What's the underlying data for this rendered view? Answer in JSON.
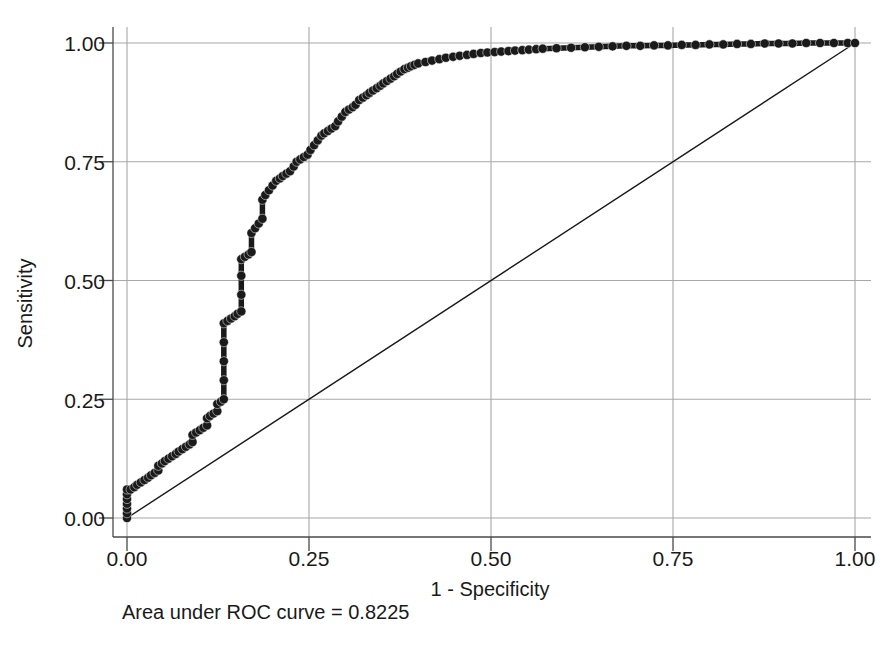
{
  "chart_data": {
    "type": "line",
    "title": "",
    "xlabel": "1 - Specificity",
    "ylabel": "Sensitivity",
    "xlim": [
      0,
      1
    ],
    "ylim": [
      0,
      1
    ],
    "grid": true,
    "legend": null,
    "annotation": "Area under ROC curve = 0.8225",
    "auc": 0.8225,
    "xticks": [
      "0.00",
      "0.25",
      "0.50",
      "0.75",
      "1.00"
    ],
    "yticks": [
      "0.00",
      "0.25",
      "0.50",
      "0.75",
      "1.00"
    ],
    "xtick_values": [
      0,
      0.25,
      0.5,
      0.75,
      1
    ],
    "ytick_values": [
      0,
      0.25,
      0.5,
      0.75,
      1
    ],
    "series": [
      {
        "name": "ROC curve",
        "marker": "filled-circle",
        "color": "#1a1a1a",
        "x": [
          0.0,
          0.0,
          0.0,
          0.0,
          0.0,
          0.0,
          0.0,
          0.005,
          0.01,
          0.014,
          0.019,
          0.024,
          0.029,
          0.033,
          0.038,
          0.043,
          0.043,
          0.048,
          0.052,
          0.057,
          0.062,
          0.067,
          0.071,
          0.076,
          0.081,
          0.086,
          0.09,
          0.09,
          0.095,
          0.1,
          0.105,
          0.11,
          0.11,
          0.114,
          0.119,
          0.124,
          0.124,
          0.129,
          0.133,
          0.133,
          0.133,
          0.133,
          0.133,
          0.138,
          0.143,
          0.148,
          0.152,
          0.157,
          0.157,
          0.157,
          0.157,
          0.162,
          0.167,
          0.171,
          0.171,
          0.176,
          0.181,
          0.186,
          0.186,
          0.19,
          0.195,
          0.2,
          0.205,
          0.21,
          0.214,
          0.219,
          0.224,
          0.229,
          0.233,
          0.238,
          0.243,
          0.248,
          0.252,
          0.257,
          0.262,
          0.267,
          0.271,
          0.276,
          0.281,
          0.286,
          0.29,
          0.295,
          0.3,
          0.305,
          0.31,
          0.314,
          0.319,
          0.324,
          0.329,
          0.333,
          0.338,
          0.343,
          0.348,
          0.352,
          0.357,
          0.362,
          0.367,
          0.371,
          0.376,
          0.381,
          0.386,
          0.39,
          0.395,
          0.4,
          0.41,
          0.419,
          0.429,
          0.438,
          0.448,
          0.457,
          0.467,
          0.476,
          0.486,
          0.495,
          0.505,
          0.514,
          0.524,
          0.533,
          0.543,
          0.552,
          0.562,
          0.571,
          0.59,
          0.61,
          0.629,
          0.648,
          0.667,
          0.686,
          0.705,
          0.724,
          0.743,
          0.762,
          0.781,
          0.8,
          0.819,
          0.838,
          0.857,
          0.876,
          0.895,
          0.914,
          0.933,
          0.952,
          0.971,
          0.99,
          1.0
        ],
        "y": [
          0.0,
          0.01,
          0.02,
          0.03,
          0.04,
          0.05,
          0.06,
          0.06,
          0.065,
          0.07,
          0.075,
          0.08,
          0.085,
          0.09,
          0.095,
          0.1,
          0.11,
          0.115,
          0.12,
          0.125,
          0.13,
          0.135,
          0.14,
          0.145,
          0.15,
          0.155,
          0.16,
          0.175,
          0.18,
          0.185,
          0.19,
          0.195,
          0.21,
          0.215,
          0.22,
          0.225,
          0.24,
          0.245,
          0.25,
          0.29,
          0.33,
          0.37,
          0.41,
          0.415,
          0.42,
          0.425,
          0.43,
          0.435,
          0.47,
          0.51,
          0.545,
          0.55,
          0.555,
          0.56,
          0.6,
          0.61,
          0.62,
          0.63,
          0.67,
          0.68,
          0.69,
          0.7,
          0.71,
          0.715,
          0.72,
          0.725,
          0.73,
          0.74,
          0.75,
          0.755,
          0.76,
          0.765,
          0.775,
          0.785,
          0.795,
          0.805,
          0.81,
          0.815,
          0.82,
          0.825,
          0.835,
          0.845,
          0.855,
          0.86,
          0.865,
          0.87,
          0.88,
          0.885,
          0.89,
          0.895,
          0.9,
          0.905,
          0.91,
          0.915,
          0.92,
          0.925,
          0.93,
          0.935,
          0.94,
          0.945,
          0.948,
          0.951,
          0.954,
          0.957,
          0.96,
          0.963,
          0.966,
          0.969,
          0.971,
          0.973,
          0.975,
          0.977,
          0.979,
          0.98,
          0.981,
          0.982,
          0.983,
          0.984,
          0.985,
          0.986,
          0.987,
          0.988,
          0.989,
          0.99,
          0.991,
          0.992,
          0.993,
          0.994,
          0.994,
          0.995,
          0.995,
          0.996,
          0.996,
          0.997,
          0.997,
          0.998,
          0.998,
          0.999,
          0.999,
          0.999,
          1.0,
          1.0,
          1.0,
          1.0,
          1.0
        ]
      },
      {
        "name": "Reference diagonal",
        "marker": "none",
        "color": "#1a1a1a",
        "x": [
          0,
          1
        ],
        "y": [
          0,
          1
        ]
      }
    ]
  },
  "axes": {
    "y_title": "Sensitivity",
    "x_title": "1 - Specificity",
    "y_tick_labels": [
      "1.00",
      "0.75",
      "0.50",
      "0.25",
      "0.00"
    ],
    "x_tick_labels": [
      "0.00",
      "0.25",
      "0.50",
      "0.75",
      "1.00"
    ]
  },
  "footnote": {
    "text": "Area under ROC curve = 0.8225"
  },
  "colors": {
    "curve": "#1a1a1a",
    "grid": "#a8a8a8",
    "axis": "#4a4a4a",
    "background": "#ffffff"
  }
}
